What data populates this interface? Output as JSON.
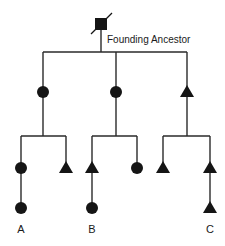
{
  "diagram": {
    "title_label": "Founding Ancestor",
    "legend": {
      "square": "founding ancestor (deceased)",
      "circle": "female",
      "triangle": "male"
    },
    "colors": {
      "line": "#2a2a2a",
      "symbol": "#151515"
    },
    "generations": [
      {
        "level": 0,
        "members": [
          {
            "id": "founder",
            "shape": "square",
            "deceased": true
          }
        ]
      },
      {
        "level": 1,
        "members": [
          {
            "id": "g1-left",
            "shape": "circle"
          },
          {
            "id": "g1-mid",
            "shape": "circle"
          },
          {
            "id": "g1-right",
            "shape": "triangle"
          }
        ]
      },
      {
        "level": 2,
        "members": [
          {
            "id": "g2-a",
            "shape": "circle",
            "parent": "g1-left"
          },
          {
            "id": "g2-b",
            "shape": "triangle",
            "parent": "g1-left"
          },
          {
            "id": "g2-c",
            "shape": "triangle",
            "parent": "g1-mid"
          },
          {
            "id": "g2-d",
            "shape": "circle",
            "parent": "g1-mid"
          },
          {
            "id": "g2-e",
            "shape": "triangle",
            "parent": "g1-right"
          },
          {
            "id": "g2-f",
            "shape": "triangle",
            "parent": "g1-right"
          }
        ]
      },
      {
        "level": 3,
        "members": [
          {
            "id": "A",
            "shape": "circle",
            "parent": "g2-a"
          },
          {
            "id": "B",
            "shape": "circle",
            "parent": "g2-c"
          },
          {
            "id": "C",
            "shape": "triangle",
            "parent": "g2-f"
          }
        ]
      }
    ],
    "leaf_labels": {
      "a": "A",
      "b": "B",
      "c": "C"
    }
  }
}
